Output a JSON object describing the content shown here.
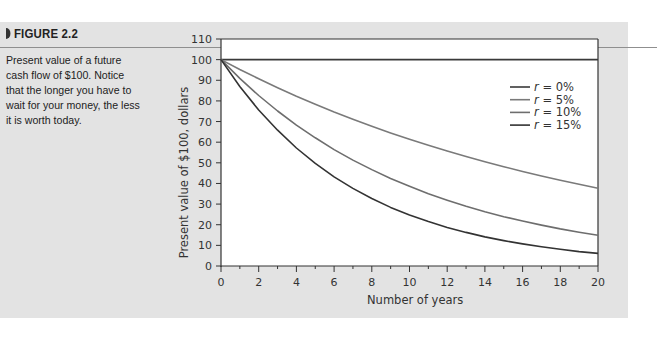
{
  "figure": {
    "label": "FIGURE 2.2",
    "caption": "Present value of a future cash flow of $100. Notice that the longer you have to wait for your money, the less it is worth today."
  },
  "colors": {
    "panel": "#e3e3e3",
    "dark_line": "#3a3a3a",
    "grey_line": "#7a7a7a"
  },
  "chart_data": {
    "type": "line",
    "title": "",
    "xlabel": "Number of years",
    "ylabel": "Present value of $100, dollars",
    "xlim": [
      0,
      20
    ],
    "ylim": [
      0,
      110
    ],
    "xticks": [
      0,
      2,
      4,
      6,
      8,
      10,
      12,
      14,
      16,
      18,
      20
    ],
    "yticks": [
      0,
      10,
      20,
      30,
      40,
      50,
      60,
      70,
      80,
      90,
      100,
      110
    ],
    "grid": false,
    "legend_position": "top-right",
    "x": [
      0,
      1,
      2,
      3,
      4,
      5,
      6,
      7,
      8,
      9,
      10,
      11,
      12,
      13,
      14,
      15,
      16,
      17,
      18,
      19,
      20
    ],
    "series": [
      {
        "name": "r = 0%",
        "prefix": "r",
        "suffix": " = 0%",
        "color": "#3a3a3a",
        "values": [
          100,
          100,
          100,
          100,
          100,
          100,
          100,
          100,
          100,
          100,
          100,
          100,
          100,
          100,
          100,
          100,
          100,
          100,
          100,
          100,
          100
        ]
      },
      {
        "name": "r = 5%",
        "prefix": "r",
        "suffix": " = 5%",
        "color": "#7a7a7a",
        "values": [
          100,
          95.2,
          90.7,
          86.4,
          82.3,
          78.4,
          74.6,
          71.1,
          67.7,
          64.5,
          61.4,
          58.5,
          55.7,
          53.0,
          50.5,
          48.1,
          45.8,
          43.6,
          41.6,
          39.6,
          37.7
        ]
      },
      {
        "name": "r = 10%",
        "prefix": "r",
        "suffix": " = 10%",
        "color": "#6e6e6e",
        "values": [
          100,
          90.9,
          82.6,
          75.1,
          68.3,
          62.1,
          56.4,
          51.3,
          46.7,
          42.4,
          38.6,
          35.0,
          31.9,
          29.0,
          26.3,
          23.9,
          21.8,
          19.8,
          18.0,
          16.4,
          14.9
        ]
      },
      {
        "name": "r = 15%",
        "prefix": "r",
        "suffix": " = 15%",
        "color": "#333333",
        "values": [
          100,
          87.0,
          75.6,
          65.8,
          57.2,
          49.7,
          43.2,
          37.6,
          32.7,
          28.4,
          24.7,
          21.5,
          18.7,
          16.3,
          14.1,
          12.3,
          10.7,
          9.3,
          8.1,
          7.0,
          6.1
        ]
      }
    ]
  }
}
